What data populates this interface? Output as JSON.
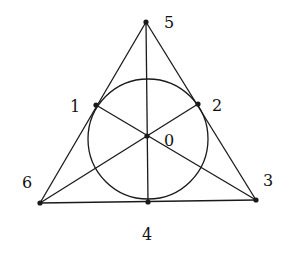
{
  "diagram": {
    "stroke_color": "#1a1a1a",
    "points": [
      {
        "id": "p0",
        "label": "0",
        "x": 147,
        "y": 136,
        "lx": 164,
        "ly": 146
      },
      {
        "id": "p1",
        "label": "1",
        "x": 96,
        "y": 105,
        "lx": 70,
        "ly": 112
      },
      {
        "id": "p2",
        "label": "2",
        "x": 198,
        "y": 104,
        "lx": 212,
        "ly": 111
      },
      {
        "id": "p3",
        "label": "3",
        "x": 256,
        "y": 200,
        "lx": 263,
        "ly": 186
      },
      {
        "id": "p4",
        "label": "4",
        "x": 148,
        "y": 202,
        "lx": 142,
        "ly": 240
      },
      {
        "id": "p5",
        "label": "5",
        "x": 146,
        "y": 22,
        "lx": 164,
        "ly": 28
      },
      {
        "id": "p6",
        "label": "6",
        "x": 40,
        "y": 203,
        "lx": 22,
        "ly": 188
      }
    ],
    "lines": [
      [
        "p5",
        "p6"
      ],
      [
        "p5",
        "p3"
      ],
      [
        "p6",
        "p3"
      ],
      [
        "p5",
        "p4"
      ],
      [
        "p1",
        "p3"
      ],
      [
        "p2",
        "p6"
      ]
    ],
    "circle": {
      "cx": 148,
      "cy": 139,
      "r": 60
    }
  }
}
